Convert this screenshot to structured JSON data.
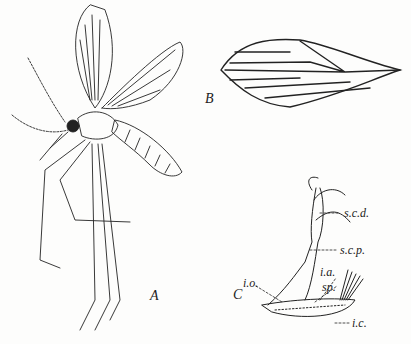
{
  "figure": {
    "panels": [
      {
        "id": "A",
        "label": "A",
        "subject": "whole adult fly (moth fly / sand fly), lateral view with wings raised"
      },
      {
        "id": "B",
        "label": "B",
        "subject": "wing venation"
      },
      {
        "id": "C",
        "label": "C",
        "subject": "genitalia / terminal structures"
      }
    ],
    "annotations": {
      "scd": "s.c.d.",
      "scp": "s.c.p.",
      "io": "i.o.",
      "ia": "i.a.",
      "sp": "sp.",
      "ic": "i.c."
    }
  }
}
